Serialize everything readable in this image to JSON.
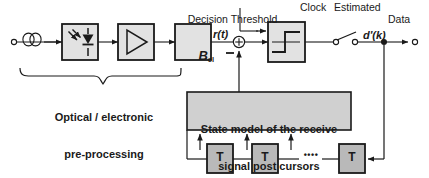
{
  "diagram": {
    "colors": {
      "stroke": "#1a1a1a",
      "text": "#1a1a1a",
      "block_light_fill": "#e2e2e2",
      "block_mid_fill": "#d0d0d0",
      "block_dark_fill": "#b9b9b9",
      "page_bg": "#ffffff"
    },
    "signal_path": {
      "input_terminal": "input-port",
      "fiber_symbol": "fiber-coil",
      "photodiode_block": "photodiode",
      "amplifier_block": "amplifier",
      "filter_block_label": "B",
      "filter_block_sub": "el",
      "node_label": "r(t)",
      "summing_sign": "−",
      "slicer_block": "decision-slicer",
      "sampler_switch": "sampling-switch",
      "output_label": "d'(k)",
      "output_terminal": "output-port"
    },
    "annotations": {
      "decision_threshold": "Decision Threshold",
      "clock": "Clock",
      "estimated_data_line1": "Estimated",
      "estimated_data_line2": "Data",
      "brace_caption_line1": "Optical / electronic",
      "brace_caption_line2": "pre-processing"
    },
    "state_model": {
      "line1": "State model of the receive",
      "line2": "signal post cursors"
    },
    "delay_line": {
      "taps": [
        {
          "label": "T"
        },
        {
          "label": "T"
        },
        {
          "label": "T"
        }
      ],
      "ellipsis": "••••"
    }
  }
}
